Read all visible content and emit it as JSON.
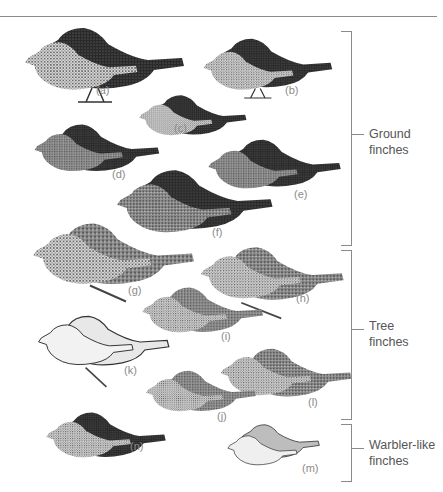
{
  "figure": {
    "groups": [
      {
        "id": "ground",
        "label_line1": "Ground",
        "label_line2": "finches",
        "members": [
          "a",
          "b",
          "c",
          "d",
          "e",
          "f"
        ]
      },
      {
        "id": "tree",
        "label_line1": "Tree",
        "label_line2": "finches",
        "members": [
          "g",
          "h",
          "i",
          "j",
          "k",
          "l",
          "n"
        ]
      },
      {
        "id": "warbler",
        "label_line1": "Warbler-like",
        "label_line2": "finches",
        "members": [
          "m"
        ]
      }
    ],
    "birds": [
      {
        "label": "(a)",
        "tone": "dark"
      },
      {
        "label": "(b)",
        "tone": "dark"
      },
      {
        "label": "(c)",
        "tone": "dark"
      },
      {
        "label": "(d)",
        "tone": "dark"
      },
      {
        "label": "(e)",
        "tone": "dark"
      },
      {
        "label": "(f)",
        "tone": "dark"
      },
      {
        "label": "(g)",
        "tone": "mixed"
      },
      {
        "label": "(h)",
        "tone": "mixed"
      },
      {
        "label": "(i)",
        "tone": "mixed"
      },
      {
        "label": "(j)",
        "tone": "mixed"
      },
      {
        "label": "(k)",
        "tone": "light"
      },
      {
        "label": "(l)",
        "tone": "mixed"
      },
      {
        "label": "(m)",
        "tone": "light"
      },
      {
        "label": "(n)",
        "tone": "dark"
      }
    ],
    "colors": {
      "line": "#8a8a8a",
      "label_text": "#555555",
      "letter_text": "#8a8a8a",
      "dark_bird": "#1c1c1c",
      "speckled_bird": "#5a5a5a",
      "light_bird": "#d8d8d8"
    }
  }
}
